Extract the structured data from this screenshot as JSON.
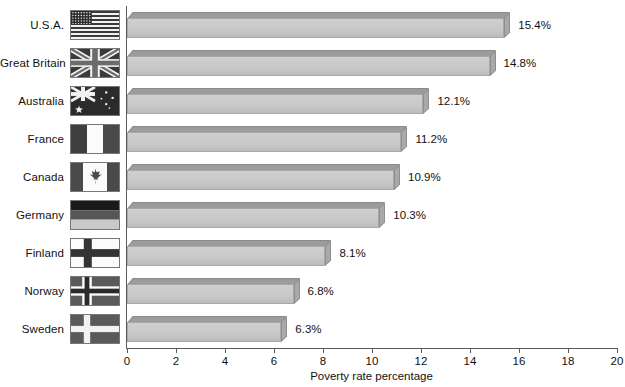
{
  "chart_data": {
    "type": "bar",
    "orientation": "horizontal",
    "title": "",
    "xlabel": "Poverty rate percentage",
    "ylabel": "",
    "xlim": [
      0,
      20
    ],
    "xticks": [
      0,
      2,
      4,
      6,
      8,
      10,
      12,
      14,
      16,
      18,
      20
    ],
    "grid": false,
    "legend": null,
    "categories": [
      "U.S.A.",
      "Great Britain",
      "Australia",
      "France",
      "Canada",
      "Germany",
      "Finland",
      "Norway",
      "Sweden"
    ],
    "values": [
      15.4,
      14.8,
      12.1,
      11.2,
      10.9,
      10.3,
      8.1,
      6.8,
      6.3
    ],
    "value_labels": [
      "15.4%",
      "14.8%",
      "12.1%",
      "11.2%",
      "10.9%",
      "10.3%",
      "8.1%",
      "6.8%",
      "6.3%"
    ],
    "bar_style": "3d-block-grayscale",
    "colors": {
      "bar_front": "#c9c9c9",
      "bar_top": "#9c9c9c",
      "bar_side": "#a9a9a9",
      "axis": "#5a5a5a",
      "text": "#111111"
    }
  },
  "rows": [
    {
      "label": "U.S.A.",
      "value": 15.4,
      "value_label": "15.4%",
      "flag": "flag-usa"
    },
    {
      "label": "Great Britain",
      "value": 14.8,
      "value_label": "14.8%",
      "flag": "flag-great-britain"
    },
    {
      "label": "Australia",
      "value": 12.1,
      "value_label": "12.1%",
      "flag": "flag-australia"
    },
    {
      "label": "France",
      "value": 11.2,
      "value_label": "11.2%",
      "flag": "flag-france"
    },
    {
      "label": "Canada",
      "value": 10.9,
      "value_label": "10.9%",
      "flag": "flag-canada"
    },
    {
      "label": "Germany",
      "value": 10.3,
      "value_label": "10.3%",
      "flag": "flag-germany"
    },
    {
      "label": "Finland",
      "value": 8.1,
      "value_label": "8.1%",
      "flag": "flag-finland"
    },
    {
      "label": "Norway",
      "value": 6.8,
      "value_label": "6.8%",
      "flag": "flag-norway"
    },
    {
      "label": "Sweden",
      "value": 6.3,
      "value_label": "6.3%",
      "flag": "flag-sweden"
    }
  ],
  "axis": {
    "x_title": "Poverty rate percentage",
    "tick_labels": [
      "0",
      "2",
      "4",
      "6",
      "8",
      "10",
      "12",
      "14",
      "16",
      "18",
      "20"
    ]
  }
}
